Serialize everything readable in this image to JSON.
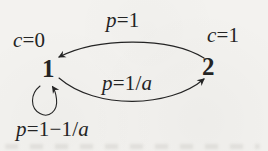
{
  "figure": {
    "type": "markov-state-transition-diagram",
    "paper_color": "#f3f2ef",
    "ink_color": "#242424"
  },
  "nodes": [
    {
      "label": "1",
      "annotation": "c=0"
    },
    {
      "label": "2",
      "annotation": "c=1"
    }
  ],
  "edges": [
    {
      "from": "2",
      "to": "1",
      "label": "p=1"
    },
    {
      "from": "1",
      "to": "2",
      "label": "p=1/a"
    },
    {
      "from": "1",
      "to": "1",
      "label": "p=1−1/a"
    }
  ]
}
